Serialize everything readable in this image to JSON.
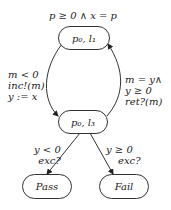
{
  "initial_condition": "p ≥ 0 ∧ x = p",
  "nodes": {
    "top": "p₀, l₁",
    "mid": "p₀, l₃",
    "pass": "Pass",
    "fail": "Fail"
  },
  "edges": {
    "left": [
      "m < 0",
      "inc!(m)",
      "y := x"
    ],
    "right": [
      "m = y∧",
      "y ≥ 0",
      "ret?(m)"
    ],
    "to_pass": [
      "y < 0",
      "exc?"
    ],
    "to_fail": [
      "y ≥ 0",
      "exc?"
    ]
  }
}
